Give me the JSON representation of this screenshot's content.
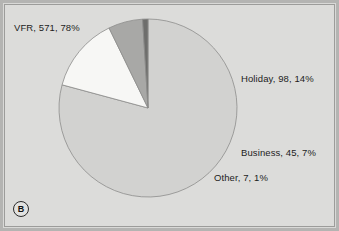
{
  "figure": {
    "panel_label": "B",
    "background_color": "#dcdcda",
    "frame_color": "#9c9c9a"
  },
  "chart_data": {
    "type": "pie",
    "title": "",
    "xlabel": "",
    "ylabel": "",
    "legend_position": "none",
    "grid": false,
    "total": 721,
    "categories": [
      "VFR",
      "Holiday",
      "Business",
      "Other"
    ],
    "values": [
      571,
      98,
      45,
      7
    ],
    "percentages": [
      78,
      14,
      7,
      1
    ],
    "colors": [
      "#d2d2d0",
      "#f7f7f5",
      "#a8a8a6",
      "#6e6e6c"
    ],
    "slice_labels": [
      "VFR, 571, 78%",
      "Holiday, 98, 14%",
      "Business, 45, 7%",
      "Other, 7, 1%"
    ],
    "start_angle_deg": 0,
    "direction": "clockwise",
    "geometry": {
      "center_x": 148,
      "center_y": 108,
      "radius": 89
    }
  },
  "labels": {
    "vfr": "VFR, 571, 78%",
    "holiday": "Holiday, 98, 14%",
    "business": "Business, 45, 7%",
    "other": "Other, 7, 1%"
  }
}
